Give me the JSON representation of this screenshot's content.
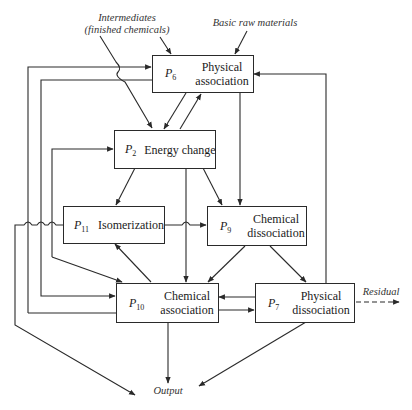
{
  "diagram": {
    "type": "process-flow",
    "inputs": {
      "intermediates_line1": "Intermediates",
      "intermediates_line2": "(finished chemicals)",
      "raw_materials": "Basic raw materials"
    },
    "outputs": {
      "output": "Output",
      "residual": "Residual"
    },
    "processes": [
      {
        "id": "P",
        "sub": "6",
        "line1": "Physical",
        "line2": "association"
      },
      {
        "id": "P",
        "sub": "2",
        "line1": "Energy change",
        "line2": ""
      },
      {
        "id": "P",
        "sub": "11",
        "line1": "Isomerization",
        "line2": ""
      },
      {
        "id": "P",
        "sub": "9",
        "line1": "Chemical",
        "line2": "dissociation"
      },
      {
        "id": "P",
        "sub": "10",
        "line1": "Chemical",
        "line2": "association"
      },
      {
        "id": "P",
        "sub": "7",
        "line1": "Physical",
        "line2": "dissociation"
      }
    ],
    "colors": {
      "line": "#2a2a2a",
      "background": "#ffffff"
    }
  }
}
